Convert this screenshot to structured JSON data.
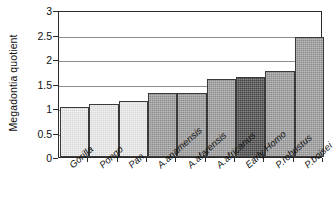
{
  "chart_data": {
    "type": "bar",
    "title": "",
    "xlabel": "",
    "ylabel": "Megadontia quotient",
    "ylim": [
      0,
      3
    ],
    "yticks": [
      "0",
      "0.5",
      "1",
      "1.5",
      "2",
      "2.5",
      "3"
    ],
    "grid": true,
    "legend": "none",
    "categories": [
      "Gorilla",
      "Pongo",
      "Pan",
      "A.anamensis",
      "A.afarensis",
      "A.africanus",
      "Early Homo",
      "P.robustus",
      "P.boisei"
    ],
    "values": [
      1.03,
      1.08,
      1.15,
      1.31,
      1.31,
      1.6,
      1.64,
      1.76,
      2.45
    ],
    "bar_colors": [
      "#ececec",
      "#ececec",
      "#ececec",
      "#9c9c9c",
      "#9c9c9c",
      "#9c9c9c",
      "#4b4b4b",
      "#9c9c9c",
      "#9c9c9c"
    ]
  },
  "style": {
    "axis_color": "#2b2b2b",
    "grid_color": "#8e8e8e",
    "bar_edge_color": "#3a3a3a",
    "background": "#ffffff",
    "text_color": "#111111"
  }
}
